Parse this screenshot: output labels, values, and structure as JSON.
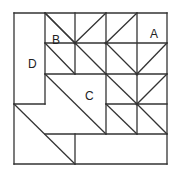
{
  "diagram": {
    "stroke": "#333333",
    "grid": {
      "xs": [
        14,
        45,
        75,
        106,
        137,
        167
      ],
      "ys": [
        13,
        43,
        74,
        104,
        134,
        164
      ]
    },
    "lines": [
      [
        14,
        13,
        167,
        13
      ],
      [
        167,
        13,
        167,
        164
      ],
      [
        167,
        164,
        14,
        164
      ],
      [
        14,
        164,
        14,
        13
      ],
      [
        45,
        13,
        45,
        104
      ],
      [
        14,
        104,
        45,
        104
      ],
      [
        45,
        43,
        167,
        43
      ],
      [
        75,
        13,
        75,
        74
      ],
      [
        106,
        13,
        106,
        74
      ],
      [
        137,
        13,
        137,
        134
      ],
      [
        45,
        74,
        167,
        74
      ],
      [
        106,
        74,
        106,
        134
      ],
      [
        106,
        104,
        167,
        104
      ],
      [
        45,
        134,
        167,
        134
      ],
      [
        75,
        134,
        75,
        164
      ],
      [
        45,
        13,
        75,
        43
      ],
      [
        75,
        43,
        45,
        13
      ],
      [
        75,
        43,
        106,
        13
      ],
      [
        106,
        43,
        137,
        13
      ],
      [
        45,
        43,
        75,
        74
      ],
      [
        75,
        43,
        106,
        74
      ],
      [
        106,
        43,
        137,
        74
      ],
      [
        137,
        74,
        167,
        43
      ],
      [
        106,
        74,
        137,
        104
      ],
      [
        137,
        104,
        167,
        74
      ],
      [
        45,
        74,
        106,
        134
      ],
      [
        106,
        104,
        137,
        134
      ],
      [
        137,
        104,
        167,
        134
      ],
      [
        14,
        104,
        75,
        164
      ]
    ],
    "dots": [
      [
        75,
        43
      ],
      [
        106,
        43
      ],
      [
        137,
        74
      ],
      [
        137,
        104
      ]
    ],
    "labels": [
      {
        "text": "A",
        "x": 150,
        "y": 28
      },
      {
        "text": "B",
        "x": 52,
        "y": 34
      },
      {
        "text": "C",
        "x": 85,
        "y": 90
      },
      {
        "text": "D",
        "x": 28,
        "y": 58
      }
    ]
  }
}
